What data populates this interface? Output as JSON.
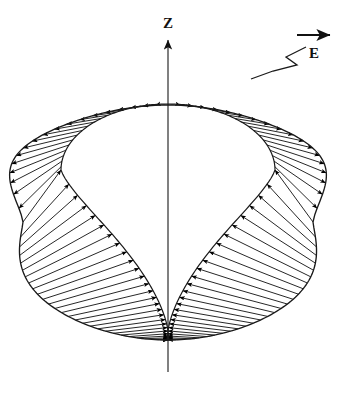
{
  "figure": {
    "name": "cardioid-field-diagram",
    "background_color": "#ffffff",
    "stroke_color": "#1a1a1a",
    "arrow_color": "#000000",
    "width": 345,
    "height": 395
  },
  "labels": {
    "z_axis": "Z",
    "field": "E"
  },
  "axis": {
    "name": "z-axis",
    "orientation": "vertical",
    "x": 168,
    "top_y": 38,
    "bottom_y": 372,
    "arrow_at": "top",
    "label_x": 168,
    "label_y": 28
  },
  "field_arrow": {
    "name": "e-field-direction-arrow",
    "x1": 297,
    "y1": 35,
    "x2": 332,
    "y2": 35,
    "label_x": 314,
    "label_y": 57
  },
  "leader": {
    "name": "zigzag-leader-line",
    "points": "305,48 285,58 295,66 272,72 252,78"
  },
  "chart_data": {
    "type": "line",
    "title": "",
    "xlabel": "",
    "ylabel": "",
    "curves": [
      {
        "name": "outer-cardioid",
        "equation": "r = a(1 + cos(theta)) rotated, cusps on z-axis",
        "center_x": 168,
        "center_y": 222,
        "cusp_top_y": 105,
        "cusp_bottom_y": 340,
        "left_extent_x": 21,
        "right_extent_x": 311
      },
      {
        "name": "inner-circle-upper",
        "center_x": 168,
        "center_y": 170,
        "radius_x": 107,
        "radius_y": 66,
        "top_y": 104,
        "left_x": 61,
        "right_x": 275
      },
      {
        "name": "inner-lower-lobes",
        "cusp_bottom_x": 168,
        "cusp_bottom_y": 340,
        "join_left_x": 84,
        "join_left_y": 226,
        "join_right_x": 252,
        "join_right_y": 226
      }
    ],
    "vector_field": {
      "direction_upper": "outward",
      "direction_lower": "inward",
      "upper_arrow_count": 36,
      "lower_arrow_count": 54,
      "note": "Radial vectors between inner boundary and outer cardioid; reversed sense in lower half"
    },
    "axis_ranges": {
      "x": [
        0,
        345
      ],
      "y": [
        0,
        395
      ]
    },
    "grid": false,
    "legend": false
  }
}
